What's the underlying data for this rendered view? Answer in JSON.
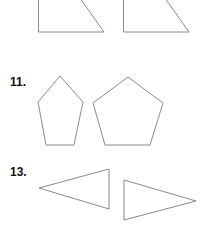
{
  "problems": [
    {
      "number": "",
      "shapes": [
        "triangle-pair-top"
      ]
    },
    {
      "number": "11.",
      "shapes": [
        "small-pentagon",
        "large-pentagon"
      ]
    },
    {
      "number": "13.",
      "shapes": [
        "left-pointing-triangle",
        "right-pointing-triangle"
      ]
    }
  ],
  "labels": {
    "problem_11": "11.",
    "problem_13": "13."
  },
  "colors": {
    "stroke": "#8a8a8a",
    "label": "#111111",
    "background": "#ffffff"
  }
}
